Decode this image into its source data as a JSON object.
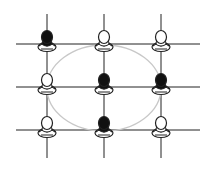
{
  "diagram": {
    "colors": {
      "line": "#222222",
      "ellipse": "#c8c8c8",
      "dark_figure": "#111111",
      "light_figure": "#ffffff"
    },
    "grid": {
      "columns_x": [
        47,
        104,
        161
      ],
      "rows_y": [
        44,
        87,
        130
      ]
    },
    "ellipse": {
      "cx": 104,
      "cy": 88,
      "rx": 57,
      "ry": 43
    },
    "figures": [
      {
        "row": 1,
        "col": 1,
        "shade": "dark"
      },
      {
        "row": 1,
        "col": 2,
        "shade": "light"
      },
      {
        "row": 1,
        "col": 3,
        "shade": "light"
      },
      {
        "row": 2,
        "col": 1,
        "shade": "light"
      },
      {
        "row": 2,
        "col": 2,
        "shade": "dark"
      },
      {
        "row": 2,
        "col": 3,
        "shade": "dark"
      },
      {
        "row": 3,
        "col": 1,
        "shade": "light"
      },
      {
        "row": 3,
        "col": 2,
        "shade": "dark"
      },
      {
        "row": 3,
        "col": 3,
        "shade": "light"
      }
    ]
  }
}
